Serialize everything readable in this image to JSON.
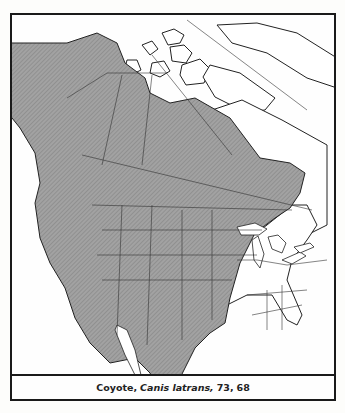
{
  "map": {
    "title": "Coyote range map",
    "region": "North America",
    "legend": {
      "range_fill": "#9a9a9a",
      "range_hatch": "#7c7c7c",
      "land_outline": "#222222",
      "water": "#ffffff"
    },
    "range_description": "Shaded area indicates range: Alaska, western and central Canada, all of western and central United States, Mexico, Great Lakes region and northeast; unshaded southeastern United States"
  },
  "caption": {
    "common_name": "Coyote,",
    "scientific_name": "Canis latrans,",
    "page_ref": "73,",
    "plate_ref": "68"
  }
}
